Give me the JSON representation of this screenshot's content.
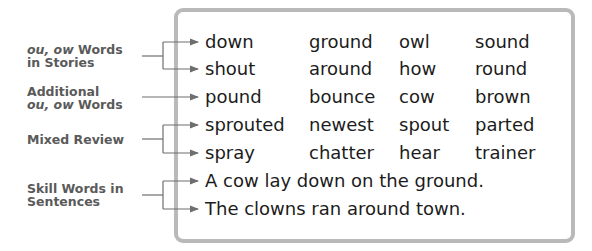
{
  "labels": [
    {
      "italic": "ou, ow",
      "text": " Words",
      "line2": "in Stories"
    },
    {
      "text": "Additional",
      "line2_italic": "ou, ow",
      "line2": " Words"
    },
    {
      "text": "Mixed Review"
    },
    {
      "text": "Skill Words in",
      "line2": "Sentences"
    }
  ],
  "rows": [
    {
      "words": [
        "down",
        "ground",
        "owl",
        "sound"
      ]
    },
    {
      "words": [
        "shout",
        "around",
        "how",
        "round"
      ]
    },
    {
      "words": [
        "pound",
        "bounce",
        "cow",
        "brown"
      ]
    },
    {
      "words": [
        "sprouted",
        "newest",
        "spout",
        "parted"
      ]
    },
    {
      "words": [
        "spray",
        "chatter",
        "hear",
        "trainer"
      ]
    }
  ],
  "sentences": [
    "A cow lay down on the ground.",
    "The clowns ran around town."
  ],
  "colors": {
    "border": "#b9b9b9",
    "arrow": "#6e6e6e",
    "label": "#5a5a5a",
    "text": "#1c1c1c"
  }
}
